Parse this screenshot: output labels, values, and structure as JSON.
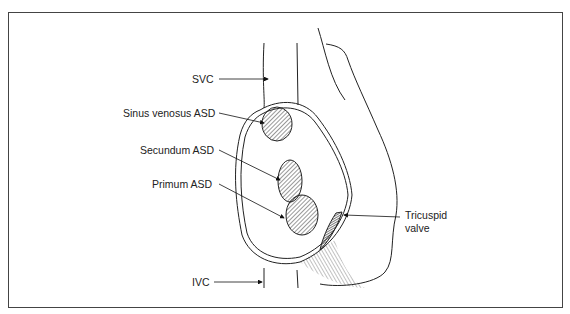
{
  "diagram": {
    "labels": {
      "svc": "SVC",
      "sinus_venosus": "Sinus venosus ASD",
      "secundum": "Secundum ASD",
      "primum": "Primum ASD",
      "tricuspid_line1": "Tricuspid",
      "tricuspid_line2": "valve",
      "ivc": "IVC"
    }
  }
}
